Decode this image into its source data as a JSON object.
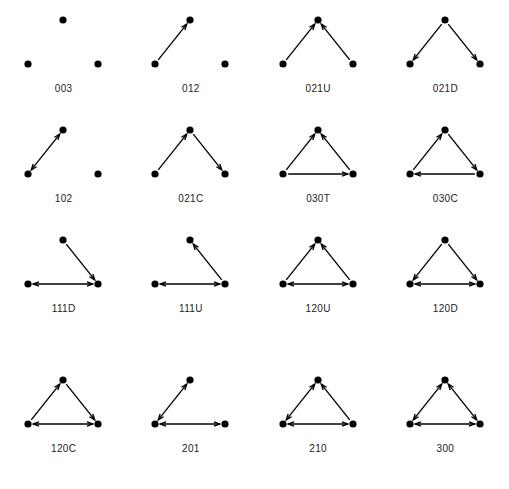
{
  "figure": {
    "type": "diagram",
    "node_count_per_triad": 3,
    "colors": {
      "background": "#ffffff",
      "node": "#000000",
      "edge": "#000000",
      "label": "#222222"
    },
    "node_positions": {
      "top": [
        63,
        16
      ],
      "bottom_left": [
        28,
        60
      ],
      "bottom_right": [
        98,
        60
      ]
    },
    "node_radius": 3.6,
    "columns": 4,
    "rows": 4
  },
  "triads": [
    {
      "label": "003",
      "name": "empty-triad",
      "edges": []
    },
    {
      "label": "012",
      "name": "single-asymmetric-triad",
      "edges": [
        {
          "from": "bottom_left",
          "to": "top",
          "type": "asymmetric"
        }
      ]
    },
    {
      "label": "021U",
      "name": "out-star-up-triad",
      "edges": [
        {
          "from": "bottom_left",
          "to": "top",
          "type": "asymmetric"
        },
        {
          "from": "bottom_right",
          "to": "top",
          "type": "asymmetric"
        }
      ]
    },
    {
      "label": "021D",
      "name": "in-star-down-triad",
      "edges": [
        {
          "from": "top",
          "to": "bottom_left",
          "type": "asymmetric"
        },
        {
          "from": "top",
          "to": "bottom_right",
          "type": "asymmetric"
        }
      ]
    },
    {
      "label": "102",
      "name": "single-mutual-triad",
      "edges": [
        {
          "from": "bottom_left",
          "to": "top",
          "type": "mutual"
        }
      ]
    },
    {
      "label": "021C",
      "name": "chain-triad",
      "edges": [
        {
          "from": "bottom_left",
          "to": "top",
          "type": "asymmetric"
        },
        {
          "from": "top",
          "to": "bottom_right",
          "type": "asymmetric"
        }
      ]
    },
    {
      "label": "030T",
      "name": "transitive-triad",
      "edges": [
        {
          "from": "bottom_left",
          "to": "top",
          "type": "asymmetric"
        },
        {
          "from": "bottom_right",
          "to": "top",
          "type": "asymmetric"
        },
        {
          "from": "bottom_left",
          "to": "bottom_right",
          "type": "asymmetric"
        }
      ]
    },
    {
      "label": "030C",
      "name": "cyclic-triad",
      "edges": [
        {
          "from": "bottom_left",
          "to": "top",
          "type": "asymmetric"
        },
        {
          "from": "top",
          "to": "bottom_right",
          "type": "asymmetric"
        },
        {
          "from": "bottom_right",
          "to": "bottom_left",
          "type": "asymmetric"
        }
      ]
    },
    {
      "label": "111D",
      "name": "mutual-plus-in-arc-triad",
      "edges": [
        {
          "from": "top",
          "to": "bottom_right",
          "type": "asymmetric"
        },
        {
          "from": "bottom_left",
          "to": "bottom_right",
          "type": "mutual"
        }
      ]
    },
    {
      "label": "111U",
      "name": "mutual-plus-out-arc-triad",
      "edges": [
        {
          "from": "bottom_right",
          "to": "top",
          "type": "asymmetric"
        },
        {
          "from": "bottom_left",
          "to": "bottom_right",
          "type": "mutual"
        }
      ]
    },
    {
      "label": "120U",
      "name": "mutual-plus-out-star-triad",
      "edges": [
        {
          "from": "bottom_left",
          "to": "top",
          "type": "asymmetric"
        },
        {
          "from": "bottom_right",
          "to": "top",
          "type": "asymmetric"
        },
        {
          "from": "bottom_left",
          "to": "bottom_right",
          "type": "mutual"
        }
      ]
    },
    {
      "label": "120D",
      "name": "mutual-plus-in-star-triad",
      "edges": [
        {
          "from": "top",
          "to": "bottom_left",
          "type": "asymmetric"
        },
        {
          "from": "top",
          "to": "bottom_right",
          "type": "asymmetric"
        },
        {
          "from": "bottom_left",
          "to": "bottom_right",
          "type": "mutual"
        }
      ]
    },
    {
      "label": "120C",
      "name": "mutual-plus-chain-triad",
      "edges": [
        {
          "from": "bottom_left",
          "to": "top",
          "type": "asymmetric"
        },
        {
          "from": "top",
          "to": "bottom_right",
          "type": "asymmetric"
        },
        {
          "from": "bottom_left",
          "to": "bottom_right",
          "type": "mutual"
        }
      ]
    },
    {
      "label": "201",
      "name": "two-mutual-triad",
      "edges": [
        {
          "from": "bottom_left",
          "to": "top",
          "type": "mutual"
        },
        {
          "from": "bottom_left",
          "to": "bottom_right",
          "type": "mutual"
        }
      ]
    },
    {
      "label": "210",
      "name": "two-mutual-plus-arc-triad",
      "edges": [
        {
          "from": "bottom_left",
          "to": "top",
          "type": "mutual"
        },
        {
          "from": "bottom_right",
          "to": "top",
          "type": "asymmetric"
        },
        {
          "from": "bottom_left",
          "to": "bottom_right",
          "type": "mutual"
        }
      ]
    },
    {
      "label": "300",
      "name": "complete-mutual-triad",
      "edges": [
        {
          "from": "bottom_left",
          "to": "top",
          "type": "mutual"
        },
        {
          "from": "bottom_right",
          "to": "top",
          "type": "mutual"
        },
        {
          "from": "bottom_left",
          "to": "bottom_right",
          "type": "mutual"
        }
      ]
    }
  ]
}
